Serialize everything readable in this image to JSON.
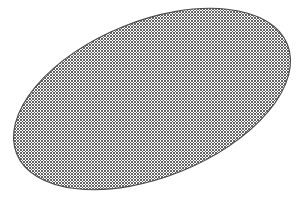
{
  "canvas": {
    "width": 304,
    "height": 199,
    "background_color": "#ffffff",
    "title": "Hatched Ellipse"
  },
  "figure": {
    "name": "mesh-filled-ellipse",
    "shape_type": "ellipse",
    "center_x": 152,
    "center_y": 99,
    "radius_x": 146,
    "radius_y": 78,
    "rotation_deg": -22,
    "outline_color": "#4a4a4a",
    "outline_width": 1.1,
    "fill_style": "diagonal-crosshatch",
    "fill_background_color": "#ffffff"
  },
  "hatch_pattern": {
    "name": "diamond-mesh",
    "pitch_px": 3,
    "line_color": "#5a5a5a",
    "line_width": 1,
    "angle_a_deg": 45,
    "angle_b_deg": -45
  },
  "chart_data": {
    "type": "scatter",
    "xlabel": "",
    "ylabel": "",
    "xlim": [
      0,
      304
    ],
    "ylim": [
      0,
      199
    ],
    "grid": false,
    "legend": "none",
    "annotations": [],
    "series": [
      {
        "name": "ellipse-outline",
        "shape": "ellipse",
        "center": [
          152,
          99
        ],
        "semi_axes": [
          146,
          78
        ],
        "rotation_deg": -22,
        "fill": "crosshatch",
        "values": []
      }
    ]
  }
}
